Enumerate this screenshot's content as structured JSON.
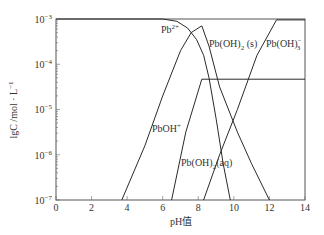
{
  "chart_data": {
    "type": "line",
    "title": "",
    "xlabel": "pH值",
    "ylabel": "lgC /mol · L⁻¹",
    "xlim": [
      0,
      14
    ],
    "ylim_log10": [
      -7,
      -3
    ],
    "grid": false,
    "legend": "inline labels",
    "x_ticks": [
      "0",
      "2",
      "4",
      "6",
      "8",
      "10",
      "12",
      "14"
    ],
    "y_ticks": [
      {
        "value": -3,
        "label": "10",
        "exp": "−3"
      },
      {
        "value": -4,
        "label": "10",
        "exp": "−4"
      },
      {
        "value": -5,
        "label": "10",
        "exp": "−5"
      },
      {
        "value": -6,
        "label": "10",
        "exp": "−6"
      },
      {
        "value": -7,
        "label": "10",
        "exp": "−7"
      }
    ],
    "series": [
      {
        "name": "Pb²⁺",
        "label_base": "Pb",
        "label_sup": "2+",
        "points_lgC": [
          [
            0,
            -3.0
          ],
          [
            6.0,
            -3.0
          ],
          [
            6.8,
            -3.05
          ],
          [
            7.4,
            -3.2
          ],
          [
            7.9,
            -3.45
          ],
          [
            8.3,
            -3.8
          ],
          [
            8.6,
            -4.3
          ],
          [
            9.0,
            -5.2
          ],
          [
            9.4,
            -6.2
          ],
          [
            9.8,
            -7.0
          ]
        ]
      },
      {
        "name": "PbOH⁺",
        "label_base": "PbOH",
        "label_sup": "+",
        "points_lgC": [
          [
            3.7,
            -7.0
          ],
          [
            5.0,
            -5.8
          ],
          [
            6.0,
            -4.7
          ],
          [
            7.0,
            -3.7
          ],
          [
            7.6,
            -3.3
          ],
          [
            8.2,
            -3.15
          ],
          [
            8.6,
            -3.6
          ],
          [
            9.2,
            -4.5
          ],
          [
            10.2,
            -5.5
          ],
          [
            11.0,
            -6.2
          ],
          [
            12.0,
            -7.0
          ]
        ]
      },
      {
        "name": "Pb(OH)₂ (s)",
        "label_base": "Pb(OH)",
        "label_sub": "2",
        "label_tail": " (s)",
        "points_lgC": [
          [
            6.5,
            -7.0
          ],
          [
            7.3,
            -5.5
          ],
          [
            8.2,
            -4.33
          ],
          [
            14.0,
            -4.33
          ]
        ]
      },
      {
        "name": "Pb(OH)₂(aq)",
        "label_base": "Pb(OH)",
        "label_sub": "2",
        "label_tail": "(aq)",
        "points_lgC": [
          [
            8.3,
            -7.0
          ],
          [
            9.2,
            -6.0
          ],
          [
            10.2,
            -5.0
          ]
        ]
      },
      {
        "name": "Pb(OH)₃⁻",
        "label_base": "Pb(OH)",
        "label_sub": "3",
        "label_sup": "−",
        "points_lgC": [
          [
            10.2,
            -5.0
          ],
          [
            11.3,
            -3.8
          ],
          [
            12.4,
            -3.02
          ],
          [
            14.0,
            -3.02
          ]
        ]
      }
    ]
  },
  "labels": {
    "xlabel": "pH值",
    "ylabel": "lgC /mol · L",
    "ylabel_sup": "−1",
    "pb2": "Pb",
    "pb2_sup": "2+",
    "pboh": "PbOH",
    "pboh_sup": "+",
    "pboh2s": "Pb(OH)",
    "pboh2s_sub": "2",
    "pboh2s_tail": " (s)",
    "pboh2aq": "Pb(OH)",
    "pboh2aq_sub": "2",
    "pboh2aq_tail": "(aq)",
    "pboh3": "Pb(OH)",
    "pboh3_sub": "3",
    "pboh3_sup": "−"
  },
  "ticks": {
    "x": [
      "0",
      "2",
      "4",
      "6",
      "8",
      "10",
      "12",
      "14"
    ],
    "y_base": "10",
    "y_exp": [
      "−3",
      "−4",
      "−5",
      "−6",
      "−7"
    ]
  }
}
